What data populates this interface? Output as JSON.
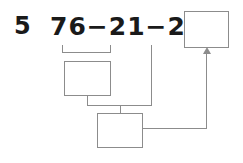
{
  "problem": {
    "number": "5",
    "equation": "76−21−24=",
    "operands": [
      76,
      21,
      24
    ],
    "operators": [
      "−",
      "−"
    ],
    "equals_sign": "=",
    "answer_boxes": [
      {
        "id": "total",
        "value": "",
        "placeholder": ""
      },
      {
        "id": "step1",
        "value": "",
        "placeholder": ""
      },
      {
        "id": "step2",
        "value": "",
        "placeholder": ""
      }
    ]
  },
  "colors": {
    "ink": "#1a1a1a",
    "rule": "#8c8c8c",
    "paper": "#ffffff"
  }
}
